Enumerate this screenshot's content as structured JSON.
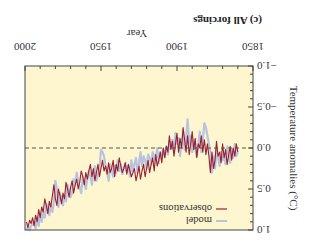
{
  "chart_data": {
    "type": "line",
    "title": "(c) All forcings",
    "xlabel": "Year",
    "ylabel": "Temperature anomalies (°C)",
    "xlim": [
      1850,
      2000
    ],
    "ylim": [
      -1.0,
      1.0
    ],
    "xticks": [
      1850,
      1900,
      1950,
      2000
    ],
    "xtick_labels": [
      "1850",
      "1900",
      "1950",
      "2000"
    ],
    "yticks": [
      -1.0,
      -0.5,
      0.0,
      0.5,
      1.0
    ],
    "ytick_labels": [
      "−1.0",
      "−0.5",
      "0.0",
      "0.5",
      "1.0"
    ],
    "zero_line": {
      "value": 0.0,
      "style": "dashed"
    },
    "grid": false,
    "orientation_note": "figure displayed rotated 180 degrees",
    "legend": {
      "position": "upper left",
      "entries": [
        "model",
        "observations"
      ]
    },
    "background_color": "#fdf6cf",
    "series": [
      {
        "name": "model",
        "color": "#b8c3e0",
        "start_year": 1860,
        "values": [
          0.05,
          0.1,
          -0.05,
          0.12,
          0.02,
          0.18,
          0.08,
          -0.02,
          0.2,
          0.1,
          0.15,
          0.05,
          0.22,
          0.12,
          0.0,
          0.25,
          0.1,
          0.3,
          0.05,
          -0.05,
          -0.15,
          -0.25,
          -0.3,
          -0.1,
          0.05,
          -0.2,
          -0.05,
          0.1,
          0.0,
          -0.1,
          0.05,
          -0.15,
          -0.05,
          -0.35,
          -0.1,
          0.02,
          -0.2,
          -0.05,
          0.1,
          -0.12,
          -0.05,
          -0.18,
          0.05,
          -0.1,
          0.0,
          -0.08,
          0.08,
          -0.02,
          0.1,
          0.02,
          0.12,
          0.05,
          0.18,
          0.0,
          0.15,
          0.1,
          0.05,
          0.2,
          0.12,
          0.08,
          0.25,
          0.15,
          0.1,
          0.22,
          0.05,
          0.18,
          0.3,
          0.12,
          0.2,
          0.28,
          0.15,
          0.35,
          0.22,
          0.3,
          0.18,
          0.25,
          0.32,
          0.2,
          0.28,
          0.15,
          0.3,
          0.22,
          0.35,
          0.25,
          0.2,
          0.4,
          0.3,
          0.22,
          0.1,
          0.05,
          0.02,
          0.25,
          0.32,
          0.4,
          0.22,
          0.3,
          0.45,
          0.35,
          0.28,
          0.38,
          0.5,
          0.42,
          0.35,
          0.55,
          0.48,
          0.4,
          0.3,
          0.45,
          0.38,
          0.55,
          0.6,
          0.52,
          0.45,
          0.65,
          0.58,
          0.7,
          0.62,
          0.55,
          0.72,
          0.5,
          0.4,
          0.65,
          0.78,
          0.7,
          0.82,
          0.75,
          0.68,
          0.85,
          0.78,
          0.9,
          0.8,
          0.95,
          0.85,
          0.98,
          0.9,
          0.92,
          0.95,
          1.0,
          0.95,
          1.0
        ]
      },
      {
        "name": "observations",
        "color": "#9b1f2e",
        "start_year": 1860,
        "values": [
          0.05,
          -0.05,
          0.1,
          0.0,
          0.15,
          -0.02,
          0.08,
          0.2,
          0.02,
          0.12,
          -0.05,
          0.18,
          0.05,
          0.1,
          -0.08,
          0.15,
          0.25,
          0.05,
          0.3,
          0.1,
          -0.05,
          0.08,
          -0.1,
          0.05,
          -0.15,
          0.0,
          -0.05,
          0.12,
          -0.12,
          0.02,
          -0.2,
          -0.05,
          0.08,
          -0.15,
          0.05,
          -0.1,
          -0.25,
          0.0,
          -0.12,
          0.05,
          -0.18,
          -0.05,
          0.1,
          -0.08,
          0.02,
          -0.15,
          0.05,
          -0.02,
          0.12,
          0.0,
          0.18,
          0.05,
          0.15,
          0.22,
          0.08,
          0.28,
          0.12,
          0.2,
          0.3,
          0.15,
          0.25,
          0.35,
          0.2,
          0.28,
          0.38,
          0.22,
          0.32,
          0.4,
          0.25,
          0.3,
          0.35,
          0.28,
          0.2,
          0.32,
          0.18,
          0.25,
          0.3,
          0.22,
          0.12,
          0.28,
          0.2,
          0.35,
          0.15,
          0.25,
          0.3,
          0.18,
          0.32,
          0.22,
          0.28,
          0.15,
          0.25,
          0.35,
          0.2,
          0.3,
          0.4,
          0.25,
          0.35,
          0.2,
          0.28,
          0.38,
          0.3,
          0.45,
          0.35,
          0.28,
          0.42,
          0.5,
          0.38,
          0.45,
          0.55,
          0.4,
          0.48,
          0.6,
          0.5,
          0.42,
          0.62,
          0.55,
          0.68,
          0.58,
          0.5,
          0.7,
          0.62,
          0.45,
          0.58,
          0.72,
          0.65,
          0.8,
          0.7,
          0.62,
          0.78,
          0.72,
          0.85,
          0.75,
          0.9,
          0.82,
          0.95,
          0.85,
          0.92,
          0.88,
          0.97,
          0.9
        ]
      }
    ]
  }
}
